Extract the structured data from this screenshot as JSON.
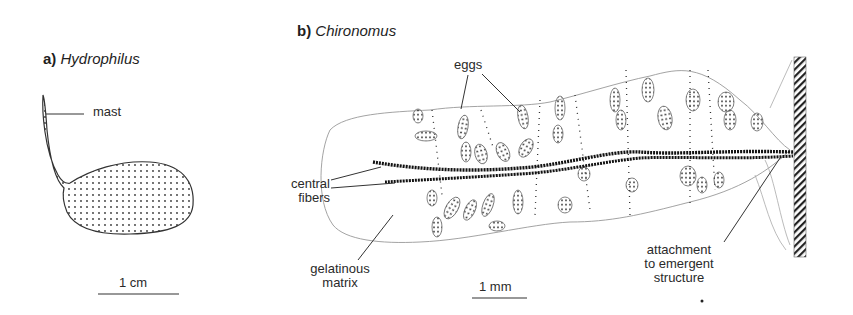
{
  "panel_a": {
    "letter": "a)",
    "taxon": "Hydrophilus",
    "labels": {
      "mast": "mast"
    },
    "scale_bar": "1 cm"
  },
  "panel_b": {
    "letter": "b)",
    "taxon": "Chironomus",
    "labels": {
      "eggs": "eggs",
      "central_fibers_1": "central",
      "central_fibers_2": "fibers",
      "gelatinous_matrix_1": "gelatinous",
      "gelatinous_matrix_2": "matrix",
      "attachment_1": "attachment",
      "attachment_2": "to emergent",
      "attachment_3": "structure"
    },
    "scale_bar": "1 mm"
  },
  "colors": {
    "ink": "#2a2a2a",
    "outline": "#8a8a8a",
    "background": "#ffffff"
  }
}
